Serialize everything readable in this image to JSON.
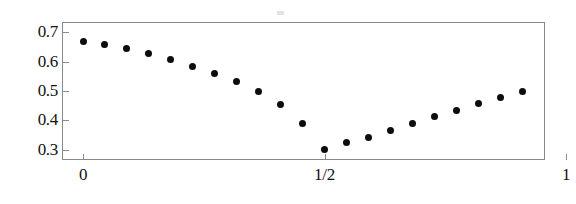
{
  "chart_data": {
    "type": "scatter",
    "title": "",
    "subtitle": "",
    "xlabel": "",
    "ylabel": "",
    "xlim": [
      -0.0435,
      0.9565
    ],
    "ylim": [
      0.2653,
      0.7347
    ],
    "grid": false,
    "legend": null,
    "marker": {
      "shape": "circle",
      "color": "#0d0d0d",
      "size": 7
    },
    "x_ticks": [
      {
        "value": 0,
        "label": "0"
      },
      {
        "value": 0.5,
        "label": "1/2"
      },
      {
        "value": 1,
        "label": "1"
      }
    ],
    "y_ticks": [
      {
        "value": 0.7,
        "label": "0.7"
      },
      {
        "value": 0.6,
        "label": "0.6"
      },
      {
        "value": 0.5,
        "label": "0.5"
      },
      {
        "value": 0.4,
        "label": "0.4"
      },
      {
        "value": 0.3,
        "label": "0.3"
      }
    ],
    "x": [
      0.0,
      0.045,
      0.091,
      0.136,
      0.182,
      0.227,
      0.273,
      0.318,
      0.364,
      0.409,
      0.455,
      0.5,
      0.545,
      0.591,
      0.636,
      0.682,
      0.727,
      0.773,
      0.818,
      0.864,
      0.909,
      0.955
    ],
    "values": [
      0.67,
      0.657,
      0.643,
      0.627,
      0.607,
      0.585,
      0.56,
      0.532,
      0.497,
      0.455,
      0.388,
      0.301,
      0.324,
      0.343,
      0.366,
      0.389,
      0.412,
      0.433,
      0.456,
      0.479,
      0.5,
      0.5
    ],
    "points": [
      {
        "x": 0.0,
        "y": 0.67
      },
      {
        "x": 0.045,
        "y": 0.657
      },
      {
        "x": 0.091,
        "y": 0.643
      },
      {
        "x": 0.136,
        "y": 0.627
      },
      {
        "x": 0.182,
        "y": 0.607
      },
      {
        "x": 0.227,
        "y": 0.585
      },
      {
        "x": 0.273,
        "y": 0.56
      },
      {
        "x": 0.318,
        "y": 0.532
      },
      {
        "x": 0.364,
        "y": 0.497
      },
      {
        "x": 0.409,
        "y": 0.455
      },
      {
        "x": 0.455,
        "y": 0.388
      },
      {
        "x": 0.5,
        "y": 0.301
      },
      {
        "x": 0.545,
        "y": 0.324
      },
      {
        "x": 0.591,
        "y": 0.343
      },
      {
        "x": 0.636,
        "y": 0.366
      },
      {
        "x": 0.682,
        "y": 0.389
      },
      {
        "x": 0.727,
        "y": 0.412
      },
      {
        "x": 0.773,
        "y": 0.433
      },
      {
        "x": 0.818,
        "y": 0.456
      },
      {
        "x": 0.864,
        "y": 0.479
      },
      {
        "x": 0.909,
        "y": 0.5
      }
    ],
    "notes": {
      "minimum_y": 0.301,
      "minimum_x": 0.5,
      "maximum_y": 0.67,
      "maximum_x": 0.0,
      "point_count": 21
    }
  },
  "figure": {
    "background_color": "#ffffff",
    "frame_color": "#8a8a8a",
    "text_color": "#121212",
    "marker_color": "#0d0d0d"
  }
}
